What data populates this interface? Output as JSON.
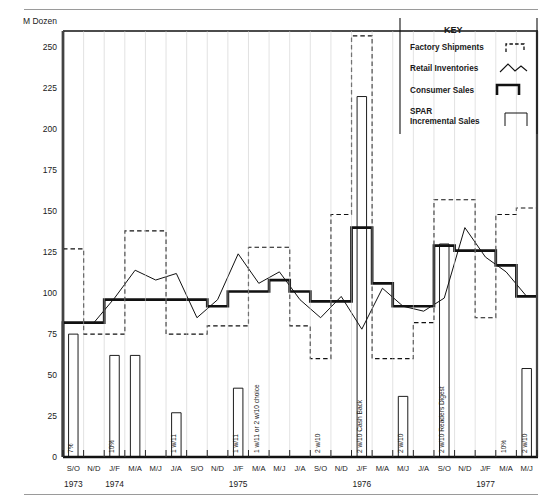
{
  "axis": {
    "y_title": "M Dozen",
    "y_ticks": [
      0,
      25,
      50,
      75,
      100,
      125,
      150,
      175,
      200,
      225,
      250
    ],
    "x_periods": [
      "S/O",
      "N/D",
      "J/F",
      "M/A",
      "M/J",
      "J/A",
      "S/O",
      "N/D",
      "J/F",
      "M/A",
      "M/J",
      "J/A",
      "S/O",
      "N/D",
      "J/F",
      "M/A",
      "M/J",
      "J/A",
      "S/O",
      "N/D",
      "J/F",
      "M/A",
      "M/J"
    ],
    "year_labels": [
      {
        "text": "1973",
        "index": 0
      },
      {
        "text": "1974",
        "index": 2
      },
      {
        "text": "1975",
        "index": 8
      },
      {
        "text": "1976",
        "index": 14
      },
      {
        "text": "1977",
        "index": 20
      }
    ]
  },
  "legend": {
    "title": "KEY",
    "items": [
      {
        "label": "Factory Shipments",
        "swatch": "dashed-step"
      },
      {
        "label": "Retail Inventories",
        "swatch": "zigzag-line"
      },
      {
        "label": "Consumer Sales",
        "swatch": "thick-step"
      },
      {
        "label": "SPAR\nIncremental Sales",
        "swatch": "thin-rect",
        "line1": "SPAR",
        "line2": "Incremental Sales"
      }
    ]
  },
  "chart_data": {
    "type": "line",
    "title": "",
    "xlabel": "",
    "ylabel": "M Dozen",
    "ylim": [
      0,
      260
    ],
    "grid": false,
    "legend_position": "top-right",
    "categories": [
      "S/O 1973",
      "N/D 1973",
      "J/F 1974",
      "M/A 1974",
      "M/J 1974",
      "J/A 1974",
      "S/O 1974",
      "N/D 1974",
      "J/F 1975",
      "M/A 1975",
      "M/J 1975",
      "J/A 1975",
      "S/O 1975",
      "N/D 1975",
      "J/F 1976",
      "M/A 1976",
      "M/J 1976",
      "J/A 1976",
      "S/O 1976",
      "N/D 1976",
      "J/F 1977",
      "M/A 1977",
      "M/J 1977"
    ],
    "series": [
      {
        "name": "Consumer Sales",
        "style": "thick-step",
        "values": [
          82,
          82,
          96,
          96,
          96,
          96,
          96,
          92,
          101,
          101,
          108,
          101,
          95,
          95,
          140,
          106,
          92,
          92,
          129,
          126,
          126,
          117,
          98
        ]
      },
      {
        "name": "Retail Inventories",
        "style": "thin-line",
        "values": [
          82,
          82,
          97,
          114,
          108,
          112,
          85,
          96,
          124,
          106,
          113,
          96,
          85,
          98,
          78,
          103,
          92,
          89,
          97,
          140,
          122,
          113,
          98
        ]
      },
      {
        "name": "Factory Shipments",
        "style": "dashed-step",
        "values": [
          127,
          75,
          75,
          138,
          138,
          75,
          75,
          80,
          80,
          128,
          128,
          80,
          60,
          148,
          257,
          60,
          60,
          82,
          157,
          157,
          85,
          148,
          152
        ]
      },
      {
        "name": "SPAR Incremental Sales",
        "style": "thin-bar",
        "values": [
          75,
          0,
          62,
          62,
          0,
          27,
          0,
          0,
          42,
          0,
          0,
          0,
          0,
          0,
          220,
          0,
          37,
          0,
          130,
          0,
          0,
          0,
          54
        ]
      }
    ],
    "bar_annotations": [
      {
        "index": 0,
        "text": "7%"
      },
      {
        "index": 2,
        "text": "10%"
      },
      {
        "index": 5,
        "text": "1 w/11"
      },
      {
        "index": 8,
        "text": "1 w/11"
      },
      {
        "index": 9,
        "text": "1 w/11 or 2 w/10 choice"
      },
      {
        "index": 12,
        "text": "2 w/10"
      },
      {
        "index": 14,
        "text": "2 w/10 Cash Back"
      },
      {
        "index": 16,
        "text": "2 w/10"
      },
      {
        "index": 18,
        "text": "2 w/10 Readers Digest"
      },
      {
        "index": 21,
        "text": "10%"
      },
      {
        "index": 22,
        "text": "2 w/10"
      }
    ]
  }
}
